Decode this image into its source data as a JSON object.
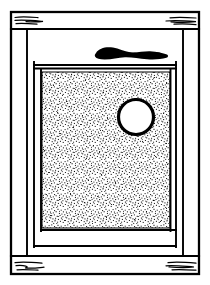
{
  "figure": {
    "title": "Cabinet door line drawing",
    "media": "ink line drawing",
    "background_color": "#ffffff",
    "ink_color": "#000000",
    "stipple_color": "#1a1a1a",
    "width": 210,
    "height": 285
  },
  "outer_frame": {
    "name": "outer rectangular frame",
    "x": 11,
    "y": 12,
    "width": 188,
    "height": 262,
    "stroke_width": 2.2
  },
  "rails": {
    "top_rail": {
      "label": "top rail",
      "y_top": 12,
      "y_bottom": 29
    },
    "bottom_rail": {
      "label": "bottom rail",
      "y_top": 256,
      "y_bottom": 274
    },
    "left_stile": {
      "label": "left stile",
      "x_left": 11,
      "x_right": 27
    },
    "right_stile": {
      "label": "right stile",
      "x_left": 183,
      "x_right": 199
    }
  },
  "inner_frame": {
    "name": "inner stile-and-rail frame",
    "x": 27,
    "y": 29,
    "width": 156,
    "height": 227,
    "stroke_width": 1.8,
    "inner_opening": {
      "x": 33,
      "y": 70,
      "width": 144,
      "height": 170
    }
  },
  "panel": {
    "name": "stippled center panel",
    "x": 42,
    "y": 72,
    "width": 128,
    "height": 156,
    "fill": "stipple",
    "dot_count": 4200
  },
  "hole": {
    "name": "circular hole",
    "cx": 136,
    "cy": 117,
    "r": 17.5,
    "stroke_width": 3.2,
    "fill": "#ffffff"
  },
  "smudge": {
    "name": "black irregular mark on top rail",
    "x": 95,
    "y": 47,
    "width": 73,
    "height": 13,
    "fill": "#000000"
  },
  "grain_marks": [
    {
      "corner": "top-left",
      "lines": 3
    },
    {
      "corner": "top-right",
      "lines": 3
    },
    {
      "corner": "bottom-left",
      "lines": 3
    },
    {
      "corner": "bottom-right",
      "lines": 3
    }
  ]
}
